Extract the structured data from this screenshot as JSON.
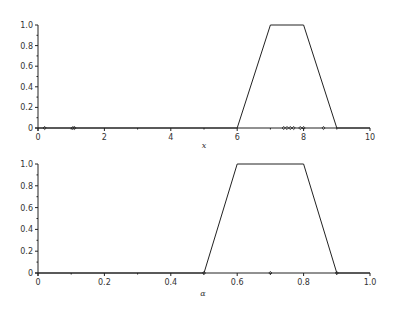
{
  "chart_data": [
    {
      "type": "line",
      "title": "",
      "xlabel": "x",
      "ylabel": "",
      "xlim": [
        0,
        10
      ],
      "ylim": [
        0,
        1.0
      ],
      "xticks": [
        0,
        2,
        4,
        6,
        8,
        10
      ],
      "xtick_labels": [
        "0",
        "2",
        "4",
        "6",
        "8",
        "10"
      ],
      "yticks": [
        0,
        0.2,
        0.4,
        0.6,
        0.8,
        1.0
      ],
      "ytick_labels": [
        "0",
        "0.2",
        "0.4",
        "0.6",
        "0.8",
        "1.0"
      ],
      "grid": false,
      "legend": null,
      "series": [
        {
          "name": "trapezoidal membership",
          "x": [
            0,
            6,
            7,
            8,
            9,
            10
          ],
          "y": [
            0,
            0,
            1,
            1,
            0,
            0
          ]
        }
      ],
      "markers_on_axis": [
        0.2,
        1.05,
        1.1,
        7.4,
        7.5,
        7.6,
        7.7,
        7.9,
        8.0,
        8.6
      ]
    },
    {
      "type": "line",
      "title": "",
      "xlabel": "α",
      "ylabel": "",
      "xlim": [
        0,
        1.0
      ],
      "ylim": [
        0,
        1.0
      ],
      "xticks": [
        0,
        0.2,
        0.4,
        0.6,
        0.8,
        1.0
      ],
      "xtick_labels": [
        "0",
        "0.2",
        "0.4",
        "0.6",
        "0.8",
        "1.0"
      ],
      "yticks": [
        0,
        0.2,
        0.4,
        0.6,
        0.8,
        1.0
      ],
      "ytick_labels": [
        "0",
        "0.2",
        "0.4",
        "0.6",
        "0.8",
        "1.0"
      ],
      "grid": false,
      "legend": null,
      "series": [
        {
          "name": "trapezoidal membership",
          "x": [
            0,
            0.5,
            0.6,
            0.8,
            0.9,
            1.0
          ],
          "y": [
            0,
            0,
            1,
            1,
            0,
            0
          ]
        }
      ],
      "markers_on_axis": [
        0.5,
        0.7,
        0.9
      ]
    }
  ]
}
